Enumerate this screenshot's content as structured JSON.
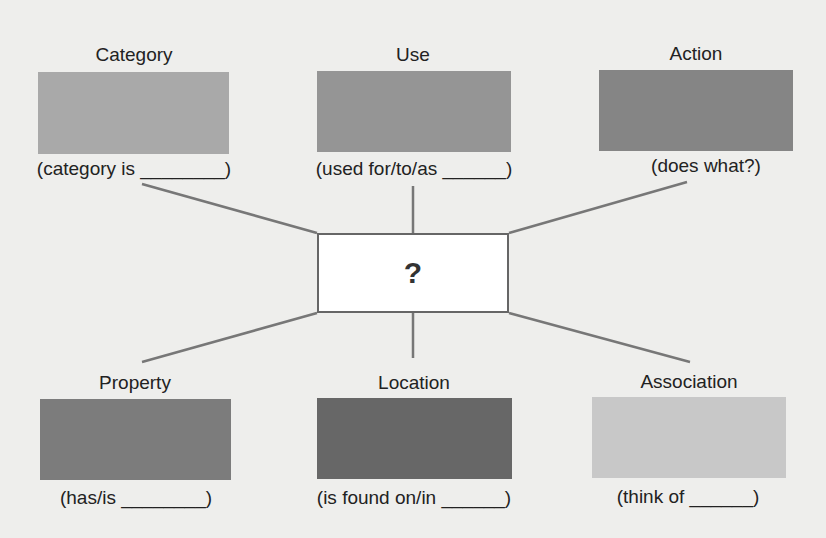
{
  "center": {
    "label": "?"
  },
  "nodes": [
    {
      "title": "Category",
      "prompt": "(category is ________)",
      "color": "#a9a9a9"
    },
    {
      "title": "Use",
      "prompt": "(used for/to/as ______)",
      "color": "#959595"
    },
    {
      "title": "Action",
      "prompt": "(does what?)",
      "color": "#858585"
    },
    {
      "title": "Property",
      "prompt": "(has/is ________)",
      "color": "#7c7c7c"
    },
    {
      "title": "Location",
      "prompt": "(is found on/in ______)",
      "color": "#676767"
    },
    {
      "title": "Association",
      "prompt": "(think of ______)",
      "color": "#c8c8c8"
    }
  ]
}
